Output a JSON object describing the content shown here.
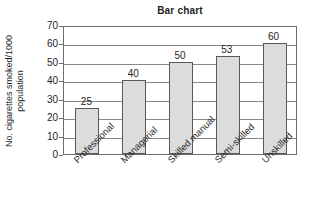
{
  "chart_data": {
    "type": "bar",
    "title": "Bar chart",
    "xlabel": "",
    "ylabel": "No. cigarettes smoked/1000 population",
    "ylabel_lines": [
      "No. cigarettes smoked/1000",
      "population"
    ],
    "categories": [
      "Professional",
      "Managerial",
      "Skilled manual",
      "Semi-skilled",
      "Unskilled"
    ],
    "values": [
      25,
      40,
      50,
      53,
      60
    ],
    "value_labels": [
      "25",
      "40",
      "50",
      "53",
      "60"
    ],
    "ylim": [
      0,
      70
    ],
    "ytick_step": 10,
    "yticks": [
      70,
      60,
      50,
      40,
      30,
      20,
      10,
      0
    ],
    "ytick_labels": [
      "70",
      "60",
      "50",
      "40",
      "30",
      "20",
      "10",
      "0"
    ],
    "grid": true,
    "grid_axis": "y",
    "legend": false,
    "legend_position": "none",
    "bar_fill_color": "#dcdcdc",
    "bar_border_color": "#585858",
    "frame_color": "#6d6d6d",
    "grid_color": "#8a8a8a",
    "text_color": "#1f1f1f",
    "background_color": "#ffffff"
  }
}
